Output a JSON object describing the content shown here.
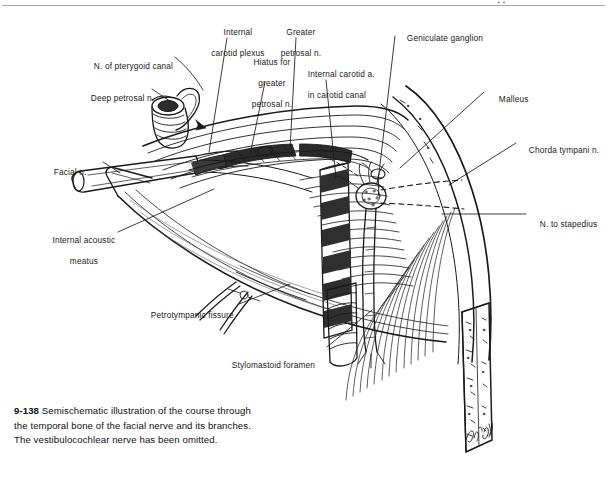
{
  "figure": {
    "number": "9-138",
    "caption_lines": [
      "Semischematic illustration of the course through",
      "the temporal bone of the facial nerve and its branches.",
      "The vestibulocochlear nerve has been omitted."
    ],
    "artist_signature": "D. Andrus",
    "rule_color": "#9a9a9a",
    "ink_color": "#1a1a1a"
  },
  "labels": {
    "internal_carotid_plexus": {
      "line1": "Internal",
      "line2": "carotid plexus"
    },
    "greater_petrosal_n": {
      "line1": "Greater",
      "line2": "petrosal n."
    },
    "geniculate_ganglion": {
      "line1": "Geniculate ganglion"
    },
    "n_of_pterygoid_canal": {
      "line1": "N. of pterygoid canal"
    },
    "hiatus_for_greater_petrosal_n": {
      "line1": "Hiatus for",
      "line2": "greater",
      "line3": "petrosal n."
    },
    "internal_carotid_a_in_carotid_canal": {
      "line1": "Internal carotid a.",
      "line2": "in carotid canal"
    },
    "deep_petrosal_n": {
      "line1": "Deep petrosal n."
    },
    "malleus": {
      "line1": "Malleus"
    },
    "chorda_tympani_n": {
      "line1": "Chorda tympani n."
    },
    "facial_n": {
      "line1": "Facial n."
    },
    "n_to_stapedius": {
      "line1": "N. to stapedius"
    },
    "internal_acoustic_meatus": {
      "line1": "Internal acoustic",
      "line2": "meatus"
    },
    "petrotympanic_fissure": {
      "line1": "Petrotympanic fissure"
    },
    "stylomastoid_foramen": {
      "line1": "Stylomastoid foramen"
    }
  }
}
